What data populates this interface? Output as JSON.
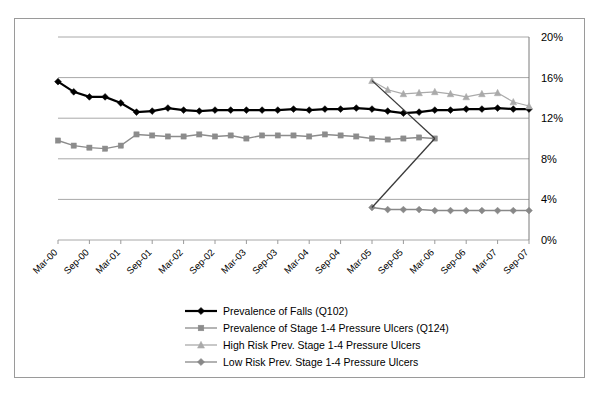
{
  "chart_data": {
    "type": "line",
    "title": "",
    "xlabel": "",
    "ylabel": "",
    "ylim": [
      0,
      20
    ],
    "yticks": [
      0,
      4,
      8,
      12,
      16,
      20
    ],
    "ytick_labels": [
      "0%",
      "4%",
      "8%",
      "12%",
      "16%",
      "20%"
    ],
    "y_axis_position": "right",
    "grid": true,
    "legend_position": "bottom",
    "x": [
      "Mar-00",
      "Jun-00",
      "Sep-00",
      "Dec-00",
      "Mar-01",
      "Jun-01",
      "Sep-01",
      "Dec-01",
      "Mar-02",
      "Jun-02",
      "Sep-02",
      "Dec-02",
      "Mar-03",
      "Jun-03",
      "Sep-03",
      "Dec-03",
      "Mar-04",
      "Jun-04",
      "Sep-04",
      "Dec-04",
      "Mar-05",
      "Jun-05",
      "Sep-05",
      "Dec-05",
      "Mar-06",
      "Jun-06",
      "Sep-06",
      "Dec-06",
      "Mar-07",
      "Jun-07",
      "Sep-07"
    ],
    "xtick_labels": [
      "Mar-00",
      "Sep-00",
      "Mar-01",
      "Sep-01",
      "Mar-02",
      "Sep-02",
      "Mar-03",
      "Sep-03",
      "Mar-04",
      "Sep-04",
      "Mar-05",
      "Sep-05",
      "Mar-06",
      "Sep-06",
      "Mar-07",
      "Sep-07"
    ],
    "xtick_label_rotation": -45,
    "series": [
      {
        "name": "Prevalence of Falls (Q102)",
        "marker": "diamond",
        "color": "#000000",
        "line_width": 2.2,
        "values": [
          15.6,
          14.6,
          14.1,
          14.1,
          13.5,
          12.6,
          12.7,
          13.0,
          12.8,
          12.7,
          12.8,
          12.8,
          12.8,
          12.8,
          12.8,
          12.9,
          12.8,
          12.9,
          12.9,
          13.0,
          12.9,
          12.7,
          12.5,
          12.6,
          12.8,
          12.8,
          12.9,
          12.9,
          13.0,
          12.9,
          12.9
        ]
      },
      {
        "name": "Prevalence of Stage 1-4 Pressure Ulcers (Q124)",
        "marker": "square",
        "color": "#8c8c8c",
        "line_width": 1.4,
        "values": [
          9.8,
          9.3,
          9.1,
          9.0,
          9.3,
          10.4,
          10.3,
          10.2,
          10.2,
          10.4,
          10.2,
          10.3,
          10.0,
          10.3,
          10.3,
          10.3,
          10.2,
          10.4,
          10.3,
          10.2,
          10.0,
          9.9,
          10.0,
          10.1,
          10.0,
          null,
          null,
          null,
          null,
          null,
          null
        ]
      },
      {
        "name": "High Risk Prev. Stage 1-4 Pressure Ulcers",
        "marker": "triangle",
        "color": "#aaaaaa",
        "line_width": 1.2,
        "values": [
          null,
          null,
          null,
          null,
          null,
          null,
          null,
          null,
          null,
          null,
          null,
          null,
          null,
          null,
          null,
          null,
          null,
          null,
          null,
          null,
          15.7,
          14.8,
          14.4,
          14.5,
          14.6,
          14.4,
          14.1,
          14.4,
          14.5,
          13.6,
          13.2
        ]
      },
      {
        "name": "Low Risk Prev. Stage 1-4 Pressure Ulcers",
        "marker": "diamond",
        "color": "#888888",
        "line_width": 1.4,
        "values": [
          null,
          null,
          null,
          null,
          null,
          null,
          null,
          null,
          null,
          null,
          null,
          null,
          null,
          null,
          null,
          null,
          null,
          null,
          null,
          null,
          3.2,
          3.0,
          3.0,
          3.0,
          2.9,
          2.9,
          2.9,
          2.9,
          2.9,
          2.9,
          2.9
        ]
      }
    ],
    "connector_note": "steep dark segment joins Q124 series end to Low Risk series start at Mar-05"
  },
  "colors": {
    "falls": "#000000",
    "ulcers_all": "#8c8c8c",
    "high_risk": "#aaaaaa",
    "low_risk": "#888888",
    "gridline": "#a8a8a8",
    "border": "#9a9a9a"
  },
  "legend": {
    "items": [
      {
        "label": "Prevalence of Falls (Q102)",
        "marker": "diamond",
        "color": "#000000"
      },
      {
        "label": "Prevalence of Stage 1-4 Pressure Ulcers (Q124)",
        "marker": "square",
        "color": "#8c8c8c"
      },
      {
        "label": "High Risk Prev. Stage 1-4 Pressure Ulcers",
        "marker": "triangle",
        "color": "#aaaaaa"
      },
      {
        "label": "Low Risk Prev. Stage 1-4 Pressure Ulcers",
        "marker": "diamond",
        "color": "#888888"
      }
    ]
  }
}
